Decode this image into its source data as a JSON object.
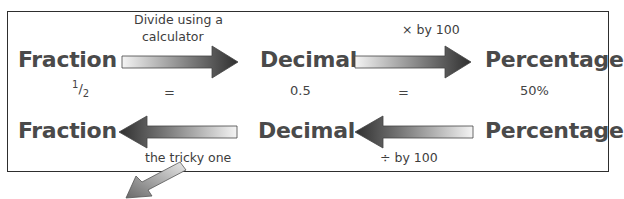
{
  "row1": {
    "labels": [
      "Fraction",
      "Decimal",
      "Percentage"
    ],
    "values": [
      "½",
      "=",
      "0.5",
      "=",
      "50%"
    ],
    "fraction_value": {
      "num": "1",
      "den": "2"
    },
    "arrows": [
      {
        "caption_line1": "Divide using a",
        "caption_line2": "calculator",
        "direction": "right"
      },
      {
        "caption": "× by 100",
        "direction": "right"
      }
    ]
  },
  "row2": {
    "labels": [
      "Fraction",
      "Decimal",
      "Percentage"
    ],
    "arrows": [
      {
        "caption": "the tricky one",
        "direction": "left"
      },
      {
        "caption": "÷ by 100",
        "direction": "left"
      }
    ]
  },
  "colors": {
    "arrow_dark": "#2f2f2f",
    "arrow_light": "#f2f2f2",
    "border": "#2e2e2e",
    "text": "#4a4a4a"
  }
}
